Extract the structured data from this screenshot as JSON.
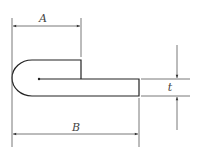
{
  "diagram": {
    "type": "engineering-dimension-drawing",
    "colors": {
      "stroke": "#222222",
      "dimension": "#555555",
      "background": "#ffffff"
    },
    "dimensions": [
      {
        "id": "A",
        "label": "A",
        "description": "length of folded-back flange from outer bend edge"
      },
      {
        "id": "B",
        "label": "B",
        "description": "overall length from outer bend edge to end of sheet"
      },
      {
        "id": "t",
        "label": "t",
        "description": "sheet thickness"
      }
    ]
  }
}
